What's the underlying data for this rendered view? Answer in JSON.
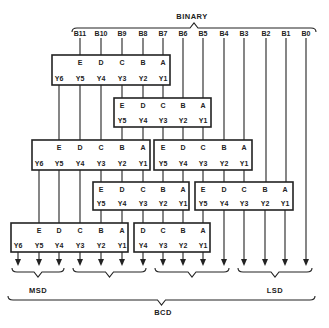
{
  "title": "BINARY",
  "bottom_label": "BCD",
  "msd_label": "MSD",
  "lsd_label": "LSD",
  "inputs": [
    "B11",
    "B10",
    "B9",
    "B8",
    "B7",
    "B6",
    "B5",
    "B4",
    "B3",
    "B2",
    "B1",
    "B0"
  ],
  "input_x": [
    80,
    101,
    122,
    143,
    163,
    183,
    203,
    224,
    244,
    266,
    286,
    306
  ],
  "modules": [
    {
      "id": "m1",
      "x": 52,
      "y": 55,
      "w": 118,
      "h": 30,
      "in": [
        "E",
        "D",
        "C",
        "B",
        "A"
      ],
      "in_x": [
        80,
        101,
        122,
        143,
        163
      ],
      "out": [
        "Y6",
        "Y5",
        "Y4",
        "Y3",
        "Y2",
        "Y1"
      ],
      "out_x": [
        59,
        80,
        101,
        122,
        143,
        163
      ]
    },
    {
      "id": "m2",
      "x": 114,
      "y": 98,
      "w": 97,
      "h": 29,
      "in": [
        "E",
        "D",
        "C",
        "B",
        "A"
      ],
      "in_x": [
        122,
        143,
        163,
        183,
        203
      ],
      "out": [
        "Y5",
        "Y4",
        "Y3",
        "Y2",
        "Y1"
      ],
      "out_x": [
        122,
        143,
        163,
        183,
        203
      ]
    },
    {
      "id": "m3",
      "x": 32,
      "y": 140,
      "w": 118,
      "h": 30,
      "in": [
        "E",
        "D",
        "C",
        "B",
        "A"
      ],
      "in_x": [
        59,
        80,
        101,
        122,
        143
      ],
      "out": [
        "Y6",
        "Y5",
        "Y4",
        "Y3",
        "Y2",
        "Y1"
      ],
      "out_x": [
        39,
        59,
        80,
        101,
        122,
        143
      ]
    },
    {
      "id": "m4",
      "x": 154,
      "y": 140,
      "w": 98,
      "h": 30,
      "in": [
        "E",
        "D",
        "C",
        "B",
        "A"
      ],
      "in_x": [
        163,
        183,
        203,
        224,
        244
      ],
      "out": [
        "Y5",
        "Y4",
        "Y3",
        "Y2",
        "Y1"
      ],
      "out_x": [
        163,
        183,
        203,
        224,
        244
      ]
    },
    {
      "id": "m5",
      "x": 93,
      "y": 182,
      "w": 96,
      "h": 28,
      "in": [
        "E",
        "D",
        "C",
        "B",
        "A"
      ],
      "in_x": [
        101,
        122,
        143,
        163,
        183
      ],
      "out": [
        "Y5",
        "Y4",
        "Y3",
        "Y2",
        "Y1"
      ],
      "out_x": [
        101,
        122,
        143,
        163,
        183
      ]
    },
    {
      "id": "m6",
      "x": 195,
      "y": 182,
      "w": 98,
      "h": 28,
      "in": [
        "E",
        "D",
        "C",
        "B",
        "A"
      ],
      "in_x": [
        203,
        224,
        244,
        265,
        285
      ],
      "out": [
        "Y5",
        "Y4",
        "Y3",
        "Y2",
        "Y1"
      ],
      "out_x": [
        203,
        224,
        244,
        265,
        285
      ]
    },
    {
      "id": "m7",
      "x": 11,
      "y": 223,
      "w": 117,
      "h": 29,
      "in": [
        "E",
        "D",
        "C",
        "B",
        "A"
      ],
      "in_x": [
        39,
        59,
        80,
        101,
        122
      ],
      "out": [
        "Y6",
        "Y5",
        "Y4",
        "Y3",
        "Y2",
        "Y1"
      ],
      "out_x": [
        18,
        39,
        59,
        80,
        101,
        122
      ]
    },
    {
      "id": "m8",
      "x": 134,
      "y": 223,
      "w": 76,
      "h": 29,
      "in": [
        "D",
        "C",
        "B",
        "A"
      ],
      "in_x": [
        143,
        163,
        183,
        203
      ],
      "out": [
        "Y4",
        "Y3",
        "Y2",
        "Y1"
      ],
      "out_x": [
        143,
        163,
        183,
        203
      ]
    }
  ],
  "wires": [
    [
      80,
      38,
      55
    ],
    [
      101,
      38,
      55
    ],
    [
      122,
      38,
      55
    ],
    [
      143,
      38,
      55
    ],
    [
      163,
      38,
      55
    ],
    [
      183,
      38,
      98
    ],
    [
      203,
      38,
      98
    ],
    [
      224,
      38,
      140
    ],
    [
      244,
      38,
      140
    ],
    [
      266,
      38,
      182
    ],
    [
      286,
      38,
      182
    ],
    [
      306,
      38,
      262
    ],
    [
      59,
      85,
      140
    ],
    [
      80,
      85,
      140
    ],
    [
      101,
      85,
      140
    ],
    [
      122,
      85,
      98
    ],
    [
      143,
      85,
      98
    ],
    [
      163,
      85,
      98
    ],
    [
      122,
      127,
      140
    ],
    [
      143,
      127,
      140
    ],
    [
      163,
      127,
      140
    ],
    [
      183,
      127,
      140
    ],
    [
      203,
      127,
      140
    ],
    [
      39,
      170,
      223
    ],
    [
      59,
      170,
      223
    ],
    [
      80,
      170,
      223
    ],
    [
      101,
      170,
      182
    ],
    [
      122,
      170,
      182
    ],
    [
      143,
      170,
      182
    ],
    [
      163,
      170,
      182
    ],
    [
      183,
      170,
      182
    ],
    [
      203,
      170,
      182
    ],
    [
      224,
      170,
      182
    ],
    [
      244,
      170,
      182
    ],
    [
      101,
      210,
      223
    ],
    [
      122,
      210,
      223
    ],
    [
      143,
      210,
      223
    ],
    [
      163,
      210,
      223
    ],
    [
      183,
      210,
      223
    ],
    [
      203,
      210,
      223
    ],
    [
      224,
      210,
      262
    ],
    [
      244,
      210,
      262
    ],
    [
      265,
      210,
      262
    ],
    [
      285,
      210,
      262
    ],
    [
      18,
      252,
      262
    ],
    [
      39,
      252,
      262
    ],
    [
      59,
      252,
      262
    ],
    [
      80,
      252,
      262
    ],
    [
      101,
      252,
      262
    ],
    [
      122,
      252,
      262
    ],
    [
      143,
      252,
      262
    ],
    [
      163,
      252,
      262
    ],
    [
      183,
      252,
      262
    ],
    [
      203,
      252,
      262
    ]
  ],
  "arrows_x": [
    18,
    39,
    59,
    80,
    101,
    122,
    143,
    163,
    183,
    203,
    224,
    244,
    265,
    285,
    306
  ],
  "braces": [
    {
      "x1": 12,
      "x2": 64,
      "y": 268,
      "dir": "down"
    },
    {
      "x1": 73,
      "x2": 146,
      "y": 268,
      "dir": "down"
    },
    {
      "x1": 155,
      "x2": 229,
      "y": 268,
      "dir": "down"
    },
    {
      "x1": 238,
      "x2": 312,
      "y": 268,
      "dir": "down"
    },
    {
      "x1": 8,
      "x2": 315,
      "y": 296,
      "dir": "down"
    },
    {
      "x1": 72,
      "x2": 316,
      "y": 32,
      "dir": "up"
    }
  ]
}
